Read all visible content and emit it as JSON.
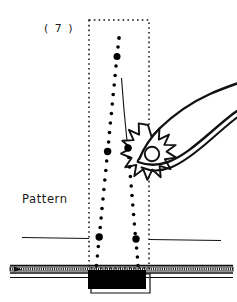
{
  "figure": {
    "kind": "technical-sewing-illustration",
    "step_label": "( 7 )",
    "pattern_label": "Pattern",
    "colors": {
      "ink": "#111111",
      "paper": "#ffffff",
      "fill_black": "#000000"
    },
    "pattern_box": {
      "name": "dotted-placement-rectangle",
      "x": 89,
      "y": 20,
      "width": 60,
      "height": 248,
      "stroke": "#111111",
      "dash": "1.6 3.2"
    },
    "stitch_lines": [
      {
        "name": "left-basting-stitch-line",
        "top": {
          "x": 119,
          "y": 38
        },
        "bottom": {
          "x": 96,
          "y": 266
        },
        "dot_count": 25,
        "big_dot_indices": [
          2,
          13,
          22
        ],
        "small_radius": 1.7,
        "big_radius": 3.5
      },
      {
        "name": "right-basting-stitch-line",
        "top": {
          "x": 128,
          "y": 148
        },
        "bottom": {
          "x": 138,
          "y": 266
        },
        "dot_count": 14,
        "big_dot_indices": [
          0,
          11
        ],
        "small_radius": 1.7,
        "big_radius": 3.5
      }
    ],
    "thread_tail": {
      "name": "thread-tail-line",
      "from": {
        "x": 122,
        "y": 78
      },
      "to": {
        "x": 128,
        "y": 146
      }
    },
    "tool": {
      "name": "hand-holding-awl",
      "starburst": {
        "cx": 148,
        "cy": 148,
        "outer_r": 23,
        "inner_r": 15,
        "points": 13
      },
      "knob": {
        "cx": 152,
        "cy": 154,
        "r": 7
      }
    },
    "baseline_rules": [
      {
        "name": "pattern-rule-left",
        "x1": 22,
        "y1": 237,
        "x2": 89,
        "y2": 237
      },
      {
        "name": "pattern-rule-right",
        "x1": 149,
        "y1": 239,
        "x2": 221,
        "y2": 239
      }
    ],
    "fabric_bands": [
      {
        "name": "fabric-band-top-rule",
        "y": 265
      },
      {
        "name": "fabric-band-hatched",
        "y": 267,
        "height": 4
      },
      {
        "name": "fabric-band-bottom-rule",
        "y": 273
      },
      {
        "name": "fabric-band-lower-rule",
        "y": 277
      }
    ],
    "base_block": {
      "name": "solid-base-block",
      "x": 88,
      "y": 270,
      "width": 58,
      "height": 19,
      "fill": "#000000"
    },
    "base_outline": {
      "name": "base-block-outline",
      "x": 91,
      "y": 274,
      "width": 59,
      "height": 19
    }
  }
}
